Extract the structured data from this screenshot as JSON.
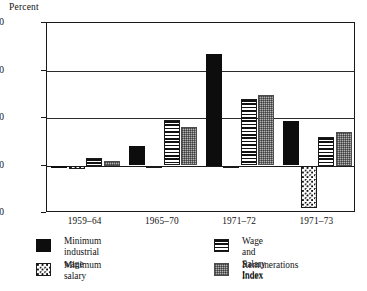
{
  "chart_data": {
    "type": "bar",
    "title": "",
    "ylabel": "Percent",
    "xlabel": "",
    "ylim": [
      -10,
      30
    ],
    "yticks": [
      30,
      20,
      10,
      0,
      -10
    ],
    "grid": true,
    "legend_position": "bottom",
    "categories": [
      "1959–64",
      "1965–70",
      "1971–72",
      "1971–73"
    ],
    "series": [
      {
        "name": "Minimum industrial wage",
        "pattern": "solid-black",
        "values": [
          -0.6,
          4.1,
          23.5,
          9.4
        ]
      },
      {
        "name": "Minimum salary",
        "pattern": "dotted",
        "values": [
          -0.7,
          -0.5,
          -0.6,
          -9.0
        ]
      },
      {
        "name": "Wage and Salary Index",
        "pattern": "horizontal-stripes",
        "values": [
          1.5,
          9.6,
          14.1,
          6.0
        ]
      },
      {
        "name": "Remunerations Index",
        "pattern": "checkered-gray",
        "values": [
          1.0,
          8.2,
          14.9,
          7.0
        ]
      }
    ]
  },
  "axis": {
    "y_title": "Percent",
    "y_tick_labels": [
      "30",
      "20",
      "10",
      "0",
      "-10"
    ],
    "x_tick_labels": [
      "1959–64",
      "1965–70",
      "1971–72",
      "1971–73"
    ]
  },
  "legend": {
    "items": [
      {
        "label": "Minimum industrial\nwage",
        "swatch": "solid-black-swatch"
      },
      {
        "label": "Wage and Salary Index",
        "swatch": "horizontal-stripes-swatch"
      },
      {
        "label": "Minimum salary",
        "swatch": "dotted-swatch"
      },
      {
        "label": "Remunerations Index",
        "swatch": "checkered-gray-swatch"
      }
    ]
  },
  "colors": {
    "black": "#0d0d0d",
    "gray": "#b3b3b3",
    "axis": "#1a1a1a",
    "background": "#ffffff"
  }
}
